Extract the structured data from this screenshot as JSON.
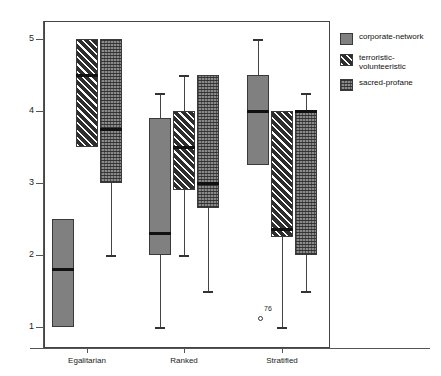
{
  "chart_data": {
    "type": "box",
    "title": "",
    "xlabel": "",
    "ylabel": "",
    "ylim": [
      0.75,
      5.35
    ],
    "yticks": [
      1,
      2,
      3,
      4,
      5
    ],
    "ytick_labels": [
      "1",
      "2",
      "3",
      "4",
      "5"
    ],
    "categories": [
      "Egalitarian",
      "Ranked",
      "Stratified"
    ],
    "grid": false,
    "legend_position": "right",
    "series": [
      {
        "name": "corporate-network",
        "fill": "solid",
        "color": "#808080",
        "boxes": [
          {
            "category": "Egalitarian",
            "whisker_low": 1.0,
            "q1": 1.0,
            "median": 1.8,
            "q3": 2.5,
            "whisker_high": 2.5
          },
          {
            "category": "Ranked",
            "whisker_low": 1.0,
            "q1": 2.0,
            "median": 2.3,
            "q3": 3.9,
            "whisker_high": 4.25
          },
          {
            "category": "Stratified",
            "whisker_low": 3.25,
            "q1": 3.25,
            "median": 4.0,
            "q3": 4.5,
            "whisker_high": 5.0
          }
        ]
      },
      {
        "name": "terroristic-volunteeristic",
        "fill": "hatch",
        "color": "#2e2e2e",
        "boxes": [
          {
            "category": "Egalitarian",
            "whisker_low": 3.5,
            "q1": 3.5,
            "median": 4.5,
            "q3": 5.0,
            "whisker_high": 5.0
          },
          {
            "category": "Ranked",
            "whisker_low": 2.0,
            "q1": 2.9,
            "median": 3.5,
            "q3": 4.0,
            "whisker_high": 4.5
          },
          {
            "category": "Stratified",
            "whisker_low": 1.0,
            "q1": 2.25,
            "median": 2.35,
            "q3": 4.0,
            "whisker_high": 4.0
          }
        ]
      },
      {
        "name": "sacred-profane",
        "fill": "dot",
        "color": "#8a8a8a",
        "boxes": [
          {
            "category": "Egalitarian",
            "whisker_low": 2.0,
            "q1": 3.0,
            "median": 3.75,
            "q3": 5.0,
            "whisker_high": 5.0
          },
          {
            "category": "Ranked",
            "whisker_low": 1.5,
            "q1": 2.65,
            "median": 3.0,
            "q3": 4.5,
            "whisker_high": 4.5
          },
          {
            "category": "Stratified",
            "whisker_low": 1.5,
            "q1": 2.0,
            "median": 4.0,
            "q3": 4.0,
            "whisker_high": 4.25
          }
        ]
      }
    ],
    "outliers": [
      {
        "label": "76",
        "category": "Stratified",
        "series": "terroristic-volunteeristic",
        "value": 1.13
      }
    ]
  },
  "legend": {
    "items": [
      {
        "label": "corporate-network"
      },
      {
        "label": "terroristic-\nvolunteeristic"
      },
      {
        "label": "sacred-profane"
      }
    ]
  },
  "axis": {
    "y_labels": [
      "5",
      "4",
      "3",
      "2",
      "1"
    ],
    "x_labels": [
      "Egalitarian",
      "Ranked",
      "Stratified"
    ]
  }
}
